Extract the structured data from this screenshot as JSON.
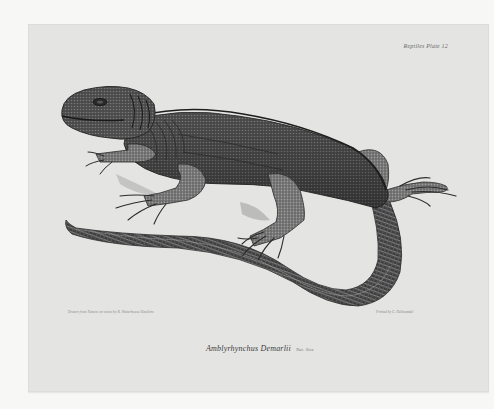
{
  "plate": {
    "plate_number": "Reptiles Plate 12",
    "credit_left": "Drawn from Nature on stone by B. Waterhouse Hawkins",
    "credit_right": "Printed by C. Hullmandel",
    "caption": {
      "species": "Amblyrhynchus Demarlii",
      "scale": "Nat. Size"
    },
    "subject": "lizard-illustration",
    "colors": {
      "page_background": "#f7f7f6",
      "plate_background": "#e4e4e2",
      "ink_dark": "#2a2a2a",
      "ink_mid": "#5a5a5a",
      "ink_light": "#9a9a9a"
    }
  }
}
